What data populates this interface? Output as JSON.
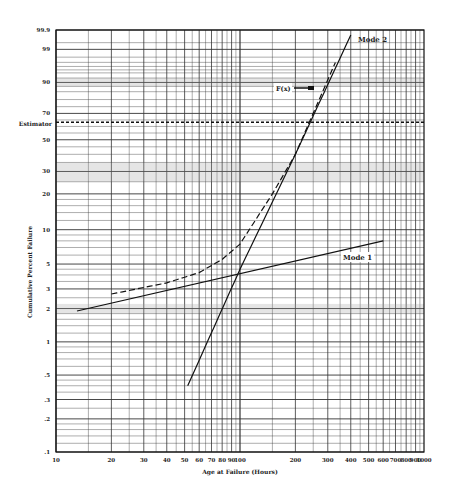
{
  "chart_data": {
    "type": "line",
    "title": "",
    "xlabel": "Age at Failure (Hours)",
    "ylabel": "Cumulative Percent Failure",
    "x_scale": "log",
    "y_scale": "weibull",
    "xlim": [
      10,
      1000
    ],
    "ylim": [
      0.1,
      99.9
    ],
    "grid": true,
    "x_ticks": [
      "10",
      "20",
      "30",
      "40",
      "50",
      "60",
      "70",
      "80",
      "90",
      "100",
      "200",
      "300",
      "400",
      "500",
      "600",
      "700",
      "800",
      "900",
      "1000"
    ],
    "y_ticks": [
      "99.9",
      "99",
      "90",
      "70",
      "50",
      "30",
      "20",
      "10",
      "5",
      "3",
      "2",
      "1",
      ".5",
      ".3",
      ".2",
      ".1"
    ],
    "estimator": {
      "label": "Estimator",
      "value": 63.2
    },
    "annotations": [
      {
        "text": "Mode 2",
        "x": 430,
        "y": 99.5
      },
      {
        "text": "Mode 1",
        "x": 390,
        "y": 5.5
      },
      {
        "text": "F(x)",
        "x": 160,
        "y": 90,
        "arrow_to_x": 240
      }
    ],
    "series": [
      {
        "name": "Mode 1",
        "style": "solid",
        "x": [
          13,
          600
        ],
        "y": [
          1.9,
          8.0
        ]
      },
      {
        "name": "Mode 2",
        "style": "solid",
        "x": [
          52,
          100,
          200,
          400
        ],
        "y": [
          0.4,
          4.5,
          40,
          99.8
        ]
      },
      {
        "name": "F(x)",
        "style": "dashed",
        "x": [
          20,
          40,
          60,
          80,
          100,
          150,
          200,
          330
        ],
        "y": [
          2.7,
          3.4,
          4.2,
          5.5,
          7.5,
          20,
          40,
          97
        ]
      }
    ]
  }
}
